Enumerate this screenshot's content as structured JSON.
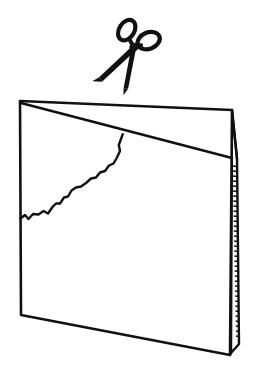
{
  "figure": {
    "title": "Folded card being cut with scissors",
    "background_color": "#ffffff",
    "ink_color": "#111111",
    "style": "black-and-white line art"
  },
  "objects": {
    "scissors": {
      "label": "scissors",
      "icon": "scissors-icon",
      "state": "open",
      "rotation_degrees": 18,
      "parts": [
        {
          "name": "left-handle-loop",
          "label": "left handle loop"
        },
        {
          "name": "right-handle-loop",
          "label": "right handle loop"
        },
        {
          "name": "pivot-screw",
          "label": "pivot"
        },
        {
          "name": "left-blade",
          "label": "left blade"
        },
        {
          "name": "right-blade",
          "label": "right blade"
        }
      ],
      "position": {
        "x": 130,
        "y": 55
      }
    },
    "card": {
      "label": "folded card",
      "icon": "folded-paper-icon",
      "panels": [
        {
          "name": "front-panel",
          "label": "front panel"
        },
        {
          "name": "back-panel",
          "label": "back panel sliver"
        }
      ],
      "features": [
        {
          "name": "fold-line",
          "label": "vertical fold / spine"
        },
        {
          "name": "diagonal-cut-line",
          "label": "straight diagonal cut line"
        },
        {
          "name": "torn-edge",
          "label": "ragged torn edge"
        },
        {
          "name": "shaded-spine",
          "label": "hatched spine edge"
        }
      ]
    }
  },
  "geometry": {
    "front_panel_points": "20,101 232,110 230,355 21,315",
    "back_panel_points": "232,110 237,158 238,345 230,355",
    "spine_sliver_points": "228,160 238,162 239,344 231,352",
    "diagonal_cut_line": "21,103 232,158",
    "fold_upper_edge": "232,110 237,159",
    "torn_edge_path": "M20,218 L25,215 L29,219 L33,214 L39,214 L44,211 L48,213 L53,207 L56,203 L60,203 L64,197 L68,196 L71,190 L76,187 L81,186 L86,183 L91,178 L96,177 L100,172 L105,171 L109,165 L114,163 L117,157 L120,151 L119,145 L121,139 L123,134",
    "hatch_count": 34
  }
}
